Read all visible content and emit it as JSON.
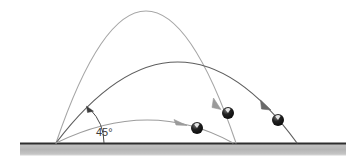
{
  "figure": {
    "background_color": "#ffffff",
    "angle_label": "45°",
    "ground": {
      "name": "ground-surface",
      "x_start": 20,
      "x_end": 346,
      "y_top": 143,
      "thickness": 12,
      "fill_color": "#b9b9b9",
      "line_color": "#2e2e2e",
      "line_width": 2
    },
    "launch_point": {
      "x": 56,
      "y": 143
    },
    "trajectories": [
      {
        "name": "trajectory-high",
        "label": "high arc",
        "color": "#a6a6a6",
        "stroke_width": 1.1,
        "launch": {
          "x": 56,
          "y": 143
        },
        "apex": {
          "x": 146,
          "y": 11
        },
        "landing": {
          "x": 236,
          "y": 143
        },
        "arrow_at": {
          "x": 219,
          "y": 106
        },
        "arrow_color": "#9a9a9a"
      },
      {
        "name": "trajectory-mid",
        "label": "middle arc",
        "color": "#5e5e5e",
        "stroke_width": 1.2,
        "launch": {
          "x": 56,
          "y": 143
        },
        "apex": {
          "x": 179,
          "y": 62
        },
        "landing": {
          "x": 297,
          "y": 143
        },
        "arrow_at": {
          "x": 268,
          "y": 110
        },
        "arrow_color": "#6a6a6a"
      },
      {
        "name": "trajectory-low",
        "label": "low arc",
        "color": "#9c9c9c",
        "stroke_width": 1.1,
        "launch": {
          "x": 56,
          "y": 143
        },
        "apex": {
          "x": 150,
          "y": 120
        },
        "landing": {
          "x": 233,
          "y": 143
        },
        "arrow_at": {
          "x": 184,
          "y": 125
        },
        "arrow_color": "#9a9a9a"
      }
    ],
    "balls": [
      {
        "name": "ball-low",
        "cx": 197,
        "cy": 128,
        "r": 6,
        "fill": "#1b1b1b",
        "highlight": "#f2f2f2"
      },
      {
        "name": "ball-high",
        "cx": 228,
        "cy": 113,
        "r": 6,
        "fill": "#1b1b1b",
        "highlight": "#f2f2f2"
      },
      {
        "name": "ball-mid",
        "cx": 278,
        "cy": 120,
        "r": 6,
        "fill": "#1b1b1b",
        "highlight": "#f2f2f2"
      }
    ],
    "angle_arc": {
      "name": "angle-arc",
      "vertex": {
        "x": 56,
        "y": 143
      },
      "radius": 48,
      "start_angle_deg": 0,
      "end_angle_deg": 45,
      "color": "#4a4a4a",
      "stroke_width": 1,
      "label_x": 96,
      "label_y": 136
    }
  }
}
